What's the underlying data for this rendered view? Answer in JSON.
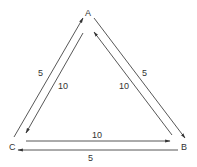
{
  "diagram": {
    "type": "directed-triangle-graph",
    "nodes": [
      {
        "id": "A",
        "label": "A"
      },
      {
        "id": "B",
        "label": "B"
      },
      {
        "id": "C",
        "label": "C"
      }
    ],
    "edges": [
      {
        "from": "C",
        "to": "A",
        "weight": "5",
        "position": "outer-left"
      },
      {
        "from": "A",
        "to": "C",
        "weight": "10",
        "position": "inner-left"
      },
      {
        "from": "A",
        "to": "B",
        "weight": "5",
        "position": "outer-right"
      },
      {
        "from": "B",
        "to": "A",
        "weight": "10",
        "position": "inner-right"
      },
      {
        "from": "C",
        "to": "B",
        "weight": "10",
        "position": "inner-bottom"
      },
      {
        "from": "B",
        "to": "C",
        "weight": "5",
        "position": "outer-bottom"
      }
    ],
    "colors": {
      "stroke": "#444444",
      "text": "#333333",
      "background": "#ffffff"
    }
  }
}
